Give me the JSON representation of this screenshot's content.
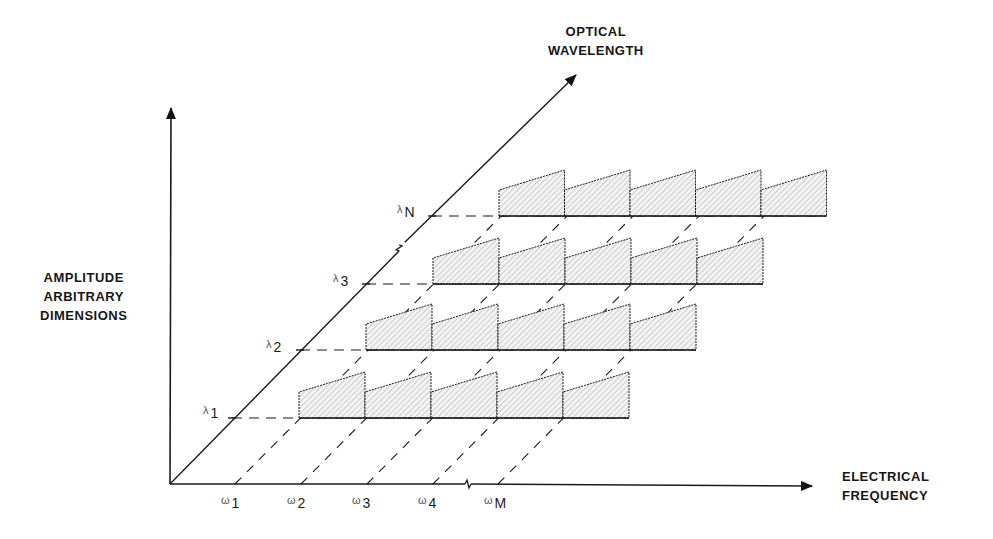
{
  "axes": {
    "vertical": {
      "label_lines": [
        "AMPLITUDE",
        "ARBITRARY",
        "DIMENSIONS"
      ]
    },
    "horizontal": {
      "label_lines": [
        "ELECTRICAL",
        "FREQUENCY"
      ]
    },
    "diagonal": {
      "label_lines": [
        "OPTICAL",
        "WAVELENGTH"
      ]
    }
  },
  "wavelength_labels": [
    {
      "symbol": "λ",
      "sub": "1"
    },
    {
      "symbol": "λ",
      "sub": "2"
    },
    {
      "symbol": "λ",
      "sub": "3"
    },
    {
      "symbol": "λ",
      "sub": "N"
    }
  ],
  "frequency_labels": [
    {
      "symbol": "ω",
      "sub": "1"
    },
    {
      "symbol": "ω",
      "sub": "2"
    },
    {
      "symbol": "ω",
      "sub": "3"
    },
    {
      "symbol": "ω",
      "sub": "4"
    },
    {
      "symbol": "ω",
      "sub": "M"
    }
  ],
  "colors": {
    "line": "#1a1a1a",
    "hatch": "#9a9a9a",
    "fill": "#f1f1f1"
  },
  "geometry": {
    "origin": [
      170,
      484
    ],
    "y_axis_top": [
      171,
      108
    ],
    "x_axis_end": [
      812,
      486
    ],
    "diag_end": [
      576,
      75
    ],
    "x_ticks": [
      235,
      301,
      367,
      433,
      498
    ],
    "x_break": 468,
    "diag_break": [
      402,
      248
    ],
    "rows": [
      {
        "baseline": 418,
        "diag_x": 232,
        "blocks_start": 299,
        "n_blocks": 5,
        "block_w": 66
      },
      {
        "baseline": 350,
        "diag_x": 300,
        "blocks_start": 366,
        "n_blocks": 5,
        "block_w": 66
      },
      {
        "baseline": 284,
        "diag_x": 366,
        "blocks_start": 433,
        "n_blocks": 5,
        "block_w": 66
      },
      {
        "baseline": 216,
        "diag_x": 432,
        "blocks_start": 499,
        "n_blocks": 5,
        "block_w": 65.5
      }
    ],
    "block_rise_left": 26,
    "block_rise_right": 46
  }
}
